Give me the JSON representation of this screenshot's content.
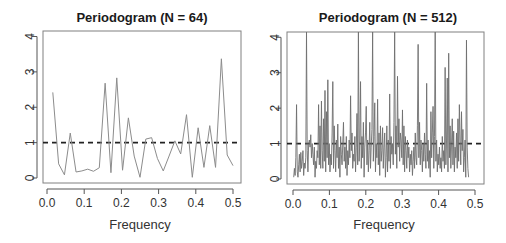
{
  "chart_data": [
    {
      "type": "line",
      "title": "Periodogram (N = 64)",
      "xlabel": "Frequency",
      "ylabel": "",
      "xlim": [
        0,
        0.5
      ],
      "ylim": [
        0,
        4
      ],
      "xticks": [
        "0.0",
        "0.1",
        "0.2",
        "0.3",
        "0.4",
        "0.5"
      ],
      "yticks": [
        "0",
        "1",
        "2",
        "3",
        "4"
      ],
      "grid": false,
      "reference_line": {
        "y": 1,
        "style": "dashed"
      },
      "x_step": 0.015625,
      "x_start": 0.015625,
      "values": [
        2.42,
        0.4,
        0.09,
        1.27,
        0.17,
        0.2,
        0.25,
        0.19,
        0.29,
        2.68,
        0.15,
        2.83,
        0.22,
        1.7,
        0.62,
        0.02,
        1.1,
        1.14,
        0.55,
        0.2,
        0.62,
        1.05,
        0.68,
        1.79,
        0.02,
        1.42,
        0.3,
        1.48,
        0.3,
        3.37,
        0.65,
        0.35
      ]
    },
    {
      "type": "line",
      "title": "Periodogram (N = 512)",
      "xlabel": "Frequency",
      "ylabel": "",
      "xlim": [
        0,
        0.5
      ],
      "ylim": [
        0,
        4
      ],
      "xticks": [
        "0.0",
        "0.1",
        "0.2",
        "0.3",
        "0.4",
        "0.5"
      ],
      "yticks": [
        "0",
        "1",
        "2",
        "3",
        "4"
      ],
      "grid": false,
      "reference_line": {
        "y": 1,
        "style": "dashed"
      },
      "x_step": 0.001953125,
      "x_start": 0.001953125,
      "values": [
        0.05,
        0.3,
        0.1,
        0.6,
        2.1,
        0.2,
        0.05,
        0.4,
        0.7,
        0.2,
        0.75,
        0.3,
        0.5,
        0.8,
        0.1,
        0.45,
        0.3,
        0.6,
        5.6,
        0.8,
        0.2,
        1.0,
        1.1,
        0.9,
        1.25,
        0.6,
        1.0,
        0.7,
        0.4,
        0.9,
        0.05,
        0.5,
        0.3,
        0.8,
        0.6,
        2.1,
        0.4,
        1.5,
        0.3,
        2.2,
        0.8,
        0.3,
        1.7,
        0.5,
        2.5,
        0.2,
        1.9,
        0.6,
        2.8,
        0.4,
        1.0,
        0.2,
        0.7,
        0.4,
        1.3,
        2.75,
        0.3,
        1.5,
        0.8,
        0.2,
        1.1,
        0.6,
        1.55,
        0.3,
        0.9,
        0.05,
        1.2,
        0.7,
        0.4,
        1.0,
        1.6,
        0.5,
        0.9,
        0.3,
        1.2,
        0.1,
        0.8,
        0.4,
        1.1,
        0.6,
        2.35,
        0.8,
        1.3,
        0.3,
        0.7,
        0.5,
        1.2,
        0.2,
        0.9,
        1.85,
        0.4,
        6.5,
        0.5,
        1.1,
        2.75,
        0.3,
        1.2,
        0.6,
        1.6,
        0.05,
        0.9,
        1.3,
        2.05,
        0.4,
        1.1,
        0.2,
        0.8,
        1.6,
        0.3,
        0.9,
        1.4,
        5.9,
        0.5,
        1.2,
        2.15,
        0.2,
        1.0,
        0.6,
        2.25,
        0.4,
        1.3,
        0.1,
        1.5,
        0.5,
        0.8,
        1.45,
        0.3,
        0.9,
        1.3,
        0.05,
        0.6,
        1.5,
        0.2,
        1.1,
        0.5,
        2.4,
        0.3,
        1.2,
        0.7,
        1.0,
        0.4,
        1.6,
        5.5,
        0.7,
        1.5,
        0.3,
        2.9,
        0.9,
        1.7,
        0.5,
        1.3,
        1.1,
        0.6,
        1.95,
        0.4,
        1.5,
        0.2,
        1.2,
        0.8,
        0.3,
        1.1,
        0.6,
        0.9,
        0.2,
        0.7,
        0.4,
        0.8,
        0.1,
        0.5,
        0.9,
        0.3,
        1.3,
        0.6,
        0.4,
        1.5,
        3.8,
        0.6,
        1.6,
        0.4,
        1.1,
        0.8,
        0.2,
        1.0,
        0.5,
        1.3,
        0.7,
        0.3,
        2.7,
        0.5,
        1.1,
        0.3,
        0.8,
        0.05,
        1.9,
        0.6,
        1.3,
        2.05,
        0.3,
        1.2,
        4.8,
        0.5,
        1.1,
        0.2,
        0.7,
        0.4,
        0.9,
        0.3,
        0.6,
        0.2,
        1.2,
        0.5,
        0.8,
        0.3,
        3.15,
        0.4,
        1.1,
        2.85,
        0.2,
        3.55,
        0.6,
        1.5,
        0.3,
        1.0,
        1.7,
        0.4,
        1.35,
        0.2,
        0.9,
        0.6,
        1.3,
        0.3,
        1.7,
        0.5,
        2.1,
        1.1,
        0.4,
        1.9,
        0.8,
        1.4,
        0.2,
        0.6,
        1.1,
        0.05,
        3.92,
        0.9,
        0.3,
        0.05
      ]
    }
  ]
}
